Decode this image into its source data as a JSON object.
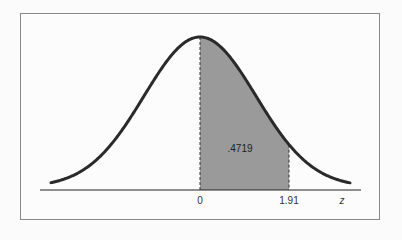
{
  "chart_data": {
    "type": "area",
    "title": "",
    "xlabel": "z",
    "ylabel": "",
    "x_ticks": [
      "0",
      "1.91"
    ],
    "shaded_region": {
      "from": 0,
      "to": 1.91,
      "area": 0.4719,
      "label": ".4719"
    },
    "grid": false,
    "legend": null,
    "colors": {
      "curve": "#2a2a2a",
      "shade": "#9a9a9a",
      "axis": "#222222",
      "border": "#8a8a8a"
    }
  },
  "labels": {
    "tick_0": "0",
    "tick_191": "1.91",
    "axis_z": "z",
    "area": ".4719"
  }
}
